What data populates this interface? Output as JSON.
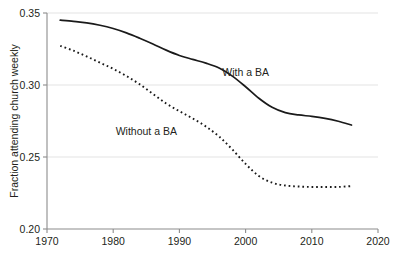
{
  "chart_data": {
    "type": "line",
    "title": "",
    "subtitle": "",
    "xlabel": "",
    "ylabel": "Fraction attending church weekly",
    "xlim": [
      1970,
      2020
    ],
    "ylim": [
      0.2,
      0.35
    ],
    "xticks": [
      "1970",
      "1980",
      "1990",
      "2000",
      "2010",
      "2020"
    ],
    "xtick_values": [
      1970,
      1980,
      1990,
      2000,
      2010,
      2020
    ],
    "yticks": [
      "0.35",
      "0.30",
      "0.25",
      "0.20"
    ],
    "ytick_values": [
      0.35,
      0.3,
      0.25,
      0.2
    ],
    "grid": "horizontal",
    "legend_position": "inline-annotations",
    "line_color": "#1a1a1a",
    "grid_color": "#e3e3e3",
    "axis_color": "#8c8c8c",
    "background": "#ffffff",
    "x": [
      1972,
      1974,
      1976,
      1978,
      1980,
      1982,
      1984,
      1986,
      1988,
      1990,
      1992,
      1994,
      1996,
      1998,
      2000,
      2002,
      2004,
      2006,
      2008,
      2010,
      2012,
      2014,
      2016
    ],
    "series": [
      {
        "name": "With a BA",
        "style": "solid",
        "label": "With a BA",
        "label_x": 2000,
        "label_y": 0.3065,
        "values": [
          0.345,
          0.3442,
          0.3432,
          0.3415,
          0.3392,
          0.3362,
          0.3325,
          0.3285,
          0.3242,
          0.3205,
          0.3178,
          0.3152,
          0.3118,
          0.3062,
          0.2988,
          0.2908,
          0.2845,
          0.2808,
          0.2792,
          0.2782,
          0.2768,
          0.2748,
          0.2722
        ]
      },
      {
        "name": "Without a BA",
        "style": "dotted",
        "label": "Without a BA",
        "label_x": 1985,
        "label_y": 0.2655,
        "values": [
          0.3272,
          0.3238,
          0.3198,
          0.3155,
          0.3112,
          0.3062,
          0.3005,
          0.2938,
          0.2872,
          0.2818,
          0.2768,
          0.2712,
          0.2642,
          0.2552,
          0.2452,
          0.2368,
          0.2322,
          0.2302,
          0.2295,
          0.2292,
          0.2292,
          0.2292,
          0.2298
        ]
      }
    ]
  }
}
